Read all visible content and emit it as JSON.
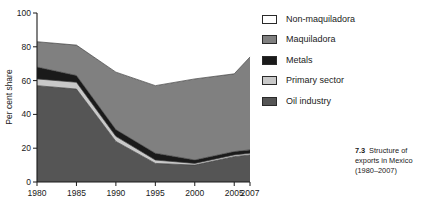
{
  "figure": {
    "caption_number": "7.3",
    "caption_text": "Structure of exports in Mexico (1980–2007)"
  },
  "axes": {
    "ylabel": "Per cent share",
    "yticks": [
      "0",
      "20",
      "40",
      "60",
      "80",
      "100"
    ],
    "xticks": [
      "1980",
      "1985",
      "1990",
      "1995",
      "2000",
      "2005",
      "2007"
    ]
  },
  "legend": {
    "items": [
      {
        "label": "Non-maquiladora",
        "color": "#ffffff"
      },
      {
        "label": "Maquiladora",
        "color": "#808080"
      },
      {
        "label": "Metals",
        "color": "#1a1a1a"
      },
      {
        "label": "Primary sector",
        "color": "#c9c9c9"
      },
      {
        "label": "Oil industry",
        "color": "#555555"
      }
    ]
  },
  "chart_data": {
    "type": "area",
    "xlabel": "",
    "ylabel": "Per cent share",
    "stacked": true,
    "grid": false,
    "legend_position": "right",
    "x": [
      1980,
      1985,
      1990,
      1995,
      2000,
      2005,
      2007
    ],
    "xlim": [
      1980,
      2007
    ],
    "ylim": [
      0,
      100
    ],
    "xticks": [
      1980,
      1985,
      1990,
      1995,
      2000,
      2005,
      2007
    ],
    "yticks": [
      0,
      20,
      40,
      60,
      80,
      100
    ],
    "series": [
      {
        "name": "Oil industry",
        "color": "#555555",
        "values": [
          57,
          55,
          24,
          11,
          10,
          15,
          16
        ]
      },
      {
        "name": "Primary sector",
        "color": "#c9c9c9",
        "values": [
          4,
          4,
          3,
          2,
          1,
          1,
          1
        ]
      },
      {
        "name": "Metals",
        "color": "#1a1a1a",
        "values": [
          7,
          4,
          4,
          4,
          2,
          2,
          2
        ]
      },
      {
        "name": "Maquiladora",
        "color": "#808080",
        "values": [
          15,
          18,
          34,
          40,
          48,
          46,
          55
        ]
      },
      {
        "name": "Non-maquiladora",
        "color": "#ffffff",
        "values": [
          17,
          19,
          35,
          43,
          39,
          36,
          26
        ]
      }
    ],
    "cumulative_tops": {
      "oil_industry": [
        57,
        55,
        24,
        11,
        10,
        15,
        16
      ],
      "primary_sector": [
        61,
        59,
        27,
        13,
        11,
        16,
        17
      ],
      "metals": [
        68,
        63,
        31,
        17,
        13,
        18,
        19
      ],
      "maquiladora": [
        83,
        81,
        65,
        57,
        61,
        64,
        74
      ],
      "non_maquiladora": [
        100,
        100,
        100,
        100,
        100,
        100,
        100
      ]
    }
  }
}
